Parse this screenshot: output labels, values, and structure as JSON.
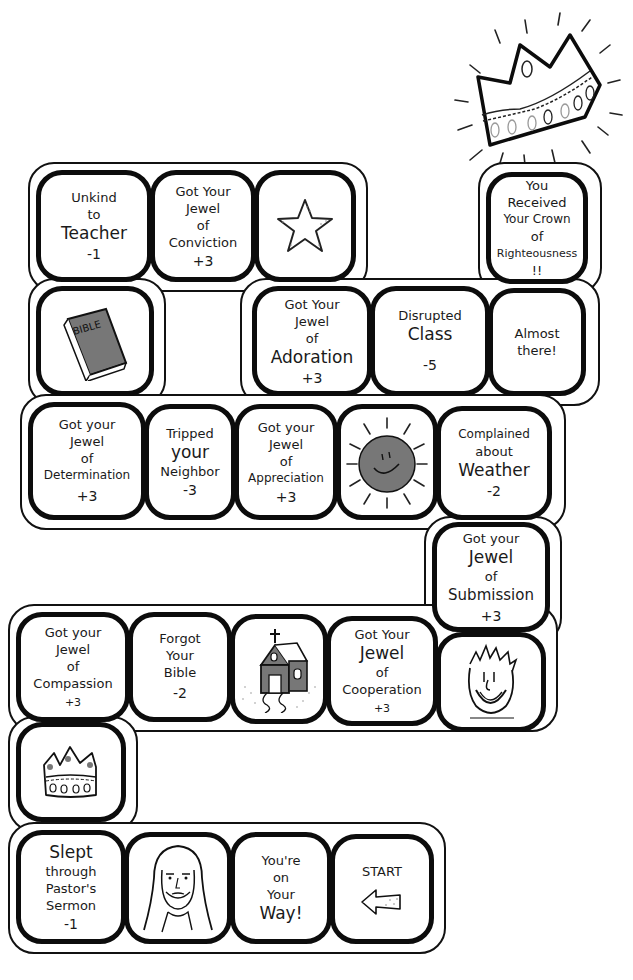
{
  "game": {
    "title": "Crown of Righteousness Board Game",
    "accent_colors": {
      "ink": "#0c0c0c",
      "fill_gray": "#777777",
      "background": "#ffffff"
    }
  },
  "top_decoration": {
    "icon": "crown-with-rays-icon"
  },
  "squares": [
    {
      "id": "unkind-teacher",
      "lines": [
        "Unkind",
        "to",
        "Teacher"
      ],
      "points": "-1"
    },
    {
      "id": "jewel-conviction",
      "lines": [
        "Got Your",
        "Jewel",
        "of",
        "Conviction"
      ],
      "points": "+3"
    },
    {
      "id": "star",
      "icon": "star-icon"
    },
    {
      "id": "crown-righteousness",
      "lines": [
        "You",
        "Received",
        "Your Crown",
        "of",
        "Righteousness",
        "!!"
      ]
    },
    {
      "id": "bible",
      "icon": "bible-book-icon",
      "icon_label": "BIBLE"
    },
    {
      "id": "jewel-adoration",
      "lines": [
        "Got Your",
        "Jewel",
        "of",
        "Adoration"
      ],
      "points": "+3"
    },
    {
      "id": "disrupted-class",
      "lines": [
        "Disrupted",
        "Class"
      ],
      "points": "-5"
    },
    {
      "id": "almost-there",
      "lines": [
        "Almost",
        "there!"
      ]
    },
    {
      "id": "jewel-determination",
      "lines": [
        "Got your",
        "Jewel",
        "of",
        "Determination"
      ],
      "points": "+3"
    },
    {
      "id": "tripped-neighbor",
      "lines": [
        "Tripped",
        "your",
        "Neighbor"
      ],
      "points": "-3"
    },
    {
      "id": "jewel-appreciation",
      "lines": [
        "Got your",
        "Jewel",
        "of",
        "Appreciation"
      ],
      "points": "+3"
    },
    {
      "id": "sun",
      "icon": "smiling-sun-icon"
    },
    {
      "id": "complained-weather",
      "lines": [
        "Complained",
        "about",
        "Weather"
      ],
      "points": "-2"
    },
    {
      "id": "jewel-submission",
      "lines": [
        "Got your",
        "Jewel",
        "of",
        "Submission"
      ],
      "points": "+3"
    },
    {
      "id": "jewel-compassion",
      "lines": [
        "Got your",
        "Jewel",
        "of",
        "Compassion"
      ],
      "points": "+3"
    },
    {
      "id": "forgot-bible",
      "lines": [
        "Forgot",
        "Your",
        "Bible"
      ],
      "points": "-2"
    },
    {
      "id": "church",
      "icon": "church-icon"
    },
    {
      "id": "jewel-cooperation",
      "lines": [
        "Got Your",
        "Jewel",
        "of",
        "Cooperation"
      ],
      "points": "+3"
    },
    {
      "id": "smiling-face",
      "icon": "smiling-face-icon"
    },
    {
      "id": "small-crown",
      "icon": "crown-icon"
    },
    {
      "id": "slept-sermon",
      "lines": [
        "Slept",
        "through",
        "Pastor's",
        "Sermon"
      ],
      "points": "-1"
    },
    {
      "id": "jesus",
      "icon": "jesus-portrait-icon"
    },
    {
      "id": "on-your-way",
      "lines": [
        "You're",
        "on",
        "Your",
        "Way!"
      ]
    },
    {
      "id": "start",
      "lines": [
        "START"
      ],
      "icon": "left-arrow-icon"
    }
  ]
}
